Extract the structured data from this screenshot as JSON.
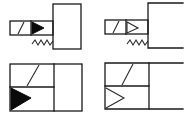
{
  "diagram": {
    "title": "",
    "colors": {
      "stroke": "#1a1a1a",
      "fill_solid": "#0a0a0a",
      "background": "#ffffff"
    },
    "symbols": [
      {
        "id": "top-left",
        "kind": "solenoid-actuator",
        "arrow": "filled",
        "has_spring": true,
        "body": "closed-box"
      },
      {
        "id": "top-right",
        "kind": "solenoid-actuator",
        "arrow": "outline",
        "has_spring": true,
        "body": "open-bracket"
      },
      {
        "id": "bottom-left",
        "kind": "valve-block",
        "arrow": "filled",
        "has_spring": false,
        "body": "closed-box"
      },
      {
        "id": "bottom-right",
        "kind": "valve-block",
        "arrow": "outline-chevron",
        "has_spring": false,
        "body": "open-bracket"
      }
    ],
    "labels": []
  }
}
